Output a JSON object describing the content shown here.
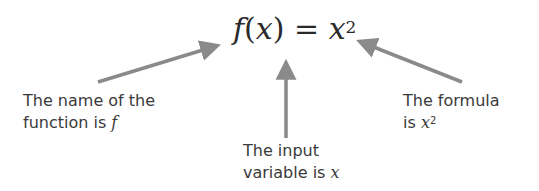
{
  "formula": {
    "func_name": "f",
    "open_paren": "(",
    "variable": "x",
    "close_paren_equals": ") = ",
    "rhs_base": "x",
    "rhs_exponent": "2"
  },
  "annotations": [
    {
      "id": "name",
      "line1": "The name of the",
      "line2_prefix": "function is ",
      "line2_symbol": "f",
      "target": "f"
    },
    {
      "id": "input",
      "line1": "The input",
      "line2_prefix": "variable is ",
      "line2_symbol": "x",
      "target": "(x)"
    },
    {
      "id": "formula",
      "line1": "The formula",
      "line2_prefix": "is ",
      "line2_symbol": "x",
      "line2_exponent": "2",
      "target": "x^2"
    }
  ],
  "colors": {
    "arrow": "#8a8a8a",
    "text": "#3a3a3a",
    "formula": "#2a2a2a",
    "background": "#ffffff"
  }
}
